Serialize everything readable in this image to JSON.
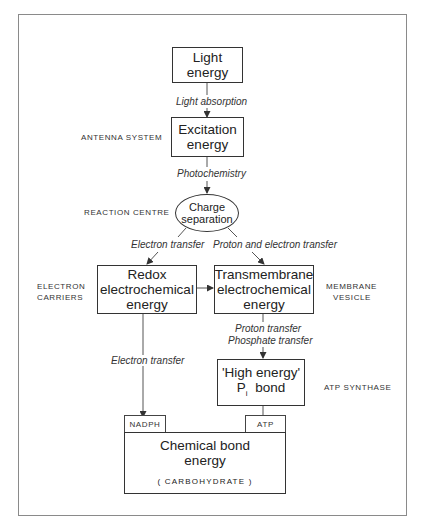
{
  "diagram": {
    "nodes": {
      "light_energy": {
        "line1": "Light",
        "line2": "energy"
      },
      "excitation_energy": {
        "line1": "Excitation",
        "line2": "energy"
      },
      "charge_separation": {
        "line1": "Charge",
        "line2": "separation"
      },
      "redox_energy": {
        "line1": "Redox",
        "line2": "electrochemical",
        "line3": "energy"
      },
      "transmembrane_energy": {
        "line1": "Transmembrane",
        "line2": "electrochemical",
        "line3": "energy"
      },
      "high_energy_bond": {
        "line1": "'High energy'",
        "p": "P",
        "p_sub": "i",
        "bond": "bond"
      },
      "chemical_bond_energy": {
        "line1": "Chemical bond",
        "line2": "energy",
        "line3": "( CARBOHYDRATE )"
      }
    },
    "tags": {
      "nadph": "NADPH",
      "atp": "ATP"
    },
    "processes": {
      "light_absorption": "Light absorption",
      "photochemistry": "Photochemistry",
      "electron_transfer_left": "Electron transfer",
      "proton_electron_transfer": "Proton and electron transfer",
      "proton_transfer": "Proton transfer",
      "phosphate_transfer": "Phosphate transfer",
      "electron_transfer_down": "Electron transfer"
    },
    "side_labels": {
      "antenna_system": "ANTENNA SYSTEM",
      "reaction_centre": "REACTION CENTRE",
      "electron_carriers_1": "ELECTRON",
      "electron_carriers_2": "CARRIERS",
      "membrane_vesicle_1": "MEMBRANE",
      "membrane_vesicle_2": "VESICLE",
      "atp_synthase": "ATP SYNTHASE"
    },
    "colors": {
      "line": "#333333",
      "frame": "#8a8a8a",
      "background": "#ffffff"
    }
  }
}
